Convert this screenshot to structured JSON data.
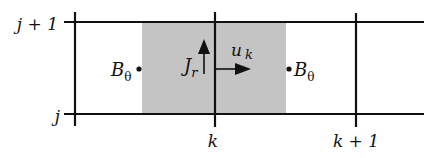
{
  "diagram": {
    "type": "staggered-grid-cell",
    "colors": {
      "line": "#111111",
      "shade": "#c4c4c4",
      "background": "#ffffff"
    },
    "row_labels": {
      "top": "j + 1",
      "bottom": "j"
    },
    "column_labels": {
      "middle": "k",
      "right": "k + 1"
    },
    "quantities": {
      "b_left": {
        "base": "B",
        "sub": "θ"
      },
      "b_right": {
        "base": "B",
        "sub": "θ"
      },
      "current": {
        "base": "J",
        "sub": "r"
      },
      "velocity": {
        "base": "u",
        "sub": "k"
      }
    }
  }
}
